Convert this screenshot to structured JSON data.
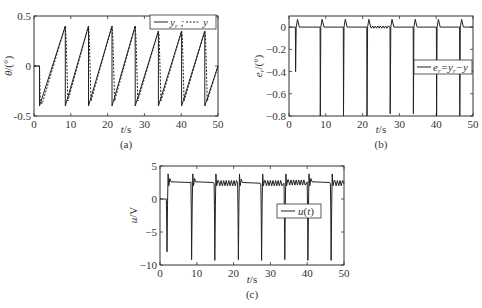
{
  "chart_data": [
    {
      "id": "a",
      "type": "line",
      "caption": "(a)",
      "xlabel": "t/s",
      "ylabel": "θ/(°)",
      "xlim": [
        0,
        50
      ],
      "ylim": [
        -0.5,
        0.5
      ],
      "xticks": [
        0,
        10,
        20,
        30,
        40,
        50
      ],
      "yticks": [
        -0.5,
        0,
        0.5
      ],
      "ytick_labels": [
        "-0.5",
        "0",
        "0.5"
      ],
      "legend": [
        "y_r",
        "y"
      ],
      "legend_text": "— y_r ; ---- y",
      "legend_position": "upper right",
      "grid": false,
      "series": [
        {
          "name": "y_r",
          "style": "solid",
          "x": [
            0,
            1.5,
            1.5,
            8.5,
            8.5,
            14.8,
            14.8,
            21.2,
            21.2,
            27.5,
            27.5,
            33.8,
            33.8,
            40.1,
            40.1,
            46.4,
            46.4,
            50
          ],
          "y": [
            0,
            0,
            -0.4,
            0.4,
            -0.4,
            0.4,
            -0.4,
            0.4,
            -0.4,
            0.4,
            -0.4,
            0.35,
            -0.4,
            0.35,
            -0.4,
            0.35,
            -0.4,
            0.0
          ]
        },
        {
          "name": "y",
          "style": "dashed",
          "x": [
            0,
            1.5,
            1.7,
            2.2,
            8.5,
            8.7,
            9.2,
            14.8,
            15.0,
            15.5,
            21.2,
            21.4,
            21.9,
            27.5,
            27.7,
            28.2,
            33.8,
            34.0,
            34.5,
            40.1,
            40.3,
            40.8,
            46.4,
            46.6,
            47.1,
            50
          ],
          "y": [
            0,
            0,
            -0.35,
            -0.38,
            0.4,
            0.3,
            -0.35,
            0.4,
            0.3,
            -0.35,
            0.4,
            0.3,
            -0.35,
            0.4,
            0.3,
            -0.35,
            0.35,
            0.3,
            -0.35,
            0.35,
            0.3,
            -0.35,
            0.35,
            0.3,
            -0.35,
            0.0
          ]
        }
      ]
    },
    {
      "id": "b",
      "type": "line",
      "caption": "(b)",
      "xlabel": "t/s",
      "ylabel": "e_r/(°)",
      "xlim": [
        0,
        50
      ],
      "ylim": [
        -0.8,
        0.1
      ],
      "xticks": [
        0,
        10,
        20,
        30,
        40,
        50
      ],
      "yticks": [
        0,
        -0.2,
        -0.4,
        -0.6,
        -0.8
      ],
      "ytick_labels": [
        "0",
        "−0.2",
        "−0.4",
        "−0.6",
        "−0.8"
      ],
      "legend": [
        "e_r=y_r−y"
      ],
      "legend_text": "e_r=y_r−y",
      "legend_position": "center right",
      "grid": false,
      "series": [
        {
          "name": "e_r=y_r−y",
          "style": "solid",
          "spikes_t": [
            1.8,
            8.5,
            14.8,
            21.2,
            27.5,
            33.8,
            40.1,
            46.4
          ],
          "spike_min": [
            -0.4,
            -0.8,
            -0.8,
            -0.8,
            -0.78,
            -0.78,
            -0.8,
            -0.8
          ],
          "overshoot_peak": 0.07,
          "baseline": 0.0
        }
      ]
    },
    {
      "id": "c",
      "type": "line",
      "caption": "(c)",
      "xlabel": "t/s",
      "ylabel": "u/V",
      "xlim": [
        0,
        50
      ],
      "ylim": [
        -10,
        5
      ],
      "xticks": [
        0,
        10,
        20,
        30,
        40,
        50
      ],
      "yticks": [
        5,
        0,
        -5,
        -10
      ],
      "ytick_labels": [
        "5",
        "0",
        "−5",
        "−10"
      ],
      "legend": [
        "u(t)"
      ],
      "legend_text": "u(t)",
      "legend_position": "center right",
      "grid": false,
      "series": [
        {
          "name": "u(t)",
          "style": "solid",
          "spikes_t": [
            1.8,
            8.5,
            14.8,
            21.2,
            27.5,
            33.8,
            40.1,
            46.4
          ],
          "spike_min": [
            -8,
            -9.2,
            -9.3,
            -9.2,
            -9.3,
            -9.2,
            -9.3,
            -9.3
          ],
          "plateau": [
            2.6,
            2.6,
            2.3,
            2.5,
            2.3,
            2.4,
            2.6,
            2.3
          ],
          "initial": 0
        }
      ]
    }
  ],
  "figure": {
    "captions": [
      "(a)",
      "(b)",
      "(c)"
    ]
  }
}
